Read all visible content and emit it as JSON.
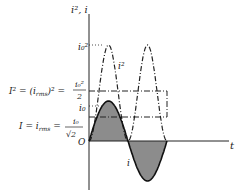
{
  "figure": {
    "y_axis_label": "i², i",
    "x_axis_label": "t",
    "origin_label": "O",
    "peak_square_label": "i₀²",
    "peak_label": "i₀",
    "curve_square_label": "i²",
    "curve_current_label": "i",
    "mean_square_lhs": "I² = (i",
    "mean_square_sub": "rms",
    "mean_square_rhs": ")² =",
    "mean_square_num": "i₀²",
    "mean_square_den": "2",
    "rms_lhs": "I = i",
    "rms_sub": "rms",
    "rms_eq": "=",
    "rms_num": "i₀",
    "rms_den": "√2"
  },
  "colors": {
    "ink": "#222222",
    "fill": "#8c8c8c"
  }
}
